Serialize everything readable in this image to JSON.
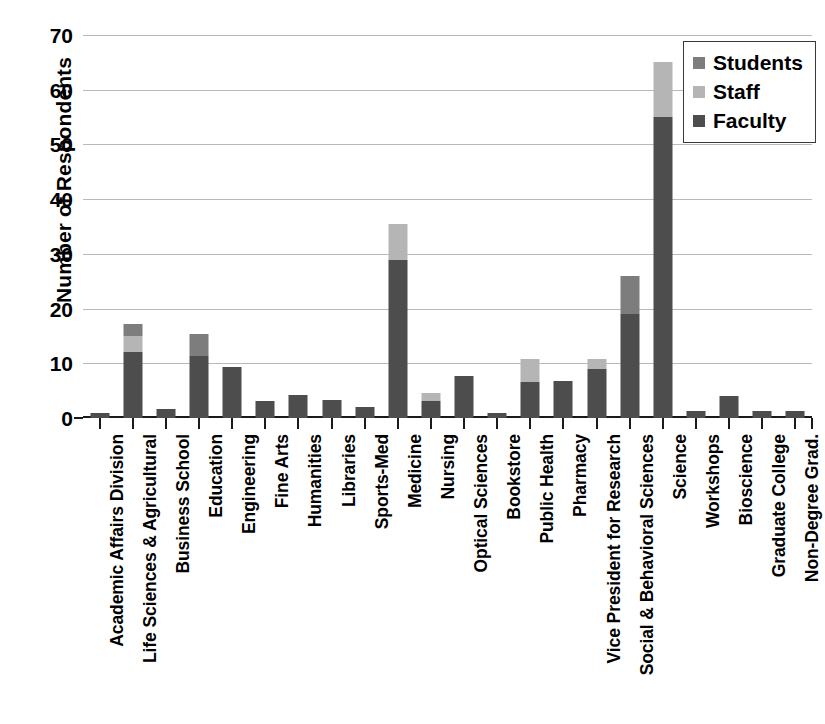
{
  "chart_data": {
    "type": "bar",
    "subtype": "stacked-bar",
    "title": "",
    "xlabel": "",
    "ylabel": "Number of Respondents",
    "ylim": [
      0,
      70
    ],
    "ytick_values": [
      0,
      10,
      20,
      30,
      40,
      50,
      60,
      70
    ],
    "ytick_labels": [
      "0",
      "10",
      "20",
      "30",
      "40",
      "50",
      "60",
      "70"
    ],
    "grid": true,
    "legend_position": "top-right",
    "categories": [
      "Academic Affairs Division",
      "Life Sciences & Agricultural",
      "Business School",
      "Education",
      "Engineering",
      "Fine Arts",
      "Humanities",
      "Libraries",
      "Sports-Med",
      "Medicine",
      "Nursing",
      "Optical Sciences",
      "Bookstore",
      "Public Health",
      "Pharmacy",
      "Vice President for Research",
      "Social & Behavioral Sciences",
      "Science",
      "Workshops",
      "Bioscience",
      "Graduate College",
      "Non-Degree Grad."
    ],
    "series": [
      {
        "name": "Faculty",
        "color": "#4d4d4d",
        "values": [
          1.0,
          12.0,
          1.7,
          11.3,
          9.3,
          3.2,
          4.2,
          3.3,
          2.1,
          28.8,
          3.2,
          7.7,
          1.0,
          6.5,
          6.7,
          9.0,
          19.0,
          55.0,
          1.3,
          4.0,
          1.3,
          1.3
        ]
      },
      {
        "name": "Staff",
        "color": "#b5b5b5",
        "values": [
          0.0,
          3.0,
          0.0,
          0.0,
          0.0,
          0.0,
          0.0,
          0.0,
          0.0,
          6.7,
          1.3,
          0.0,
          0.0,
          4.2,
          0.0,
          1.7,
          0.0,
          10.0,
          0.0,
          0.0,
          0.0,
          0.0
        ]
      },
      {
        "name": "Students",
        "color": "#7d7d7d",
        "values": [
          0.0,
          2.2,
          0.0,
          4.0,
          0.0,
          0.0,
          0.0,
          0.0,
          0.0,
          0.0,
          0.0,
          0.0,
          0.0,
          0.0,
          0.0,
          0.0,
          7.0,
          0.0,
          0.0,
          0.0,
          0.0,
          0.0
        ]
      }
    ],
    "totals": [
      1.0,
      17.2,
      1.7,
      15.3,
      9.3,
      3.2,
      4.2,
      3.3,
      2.1,
      35.5,
      4.5,
      7.7,
      1.0,
      10.7,
      6.7,
      10.7,
      26.0,
      65.0,
      1.3,
      4.0,
      1.3,
      1.3
    ]
  },
  "legend": {
    "items": [
      {
        "label": "Students",
        "color": "#7d7d7d"
      },
      {
        "label": "Staff",
        "color": "#b5b5b5"
      },
      {
        "label": "Faculty",
        "color": "#4d4d4d"
      }
    ]
  }
}
